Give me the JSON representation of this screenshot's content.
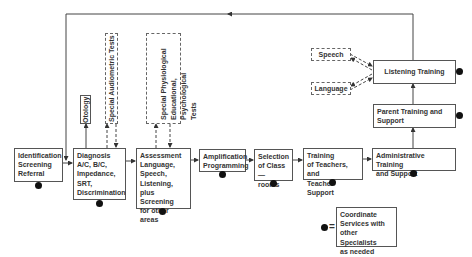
{
  "diagram": {
    "nodes": {
      "identification": {
        "lines": [
          "Identification",
          "Screening",
          "Referral"
        ]
      },
      "diagnosis": {
        "lines": [
          "Diagnosis",
          "A/C, B/C,",
          "Impedance,",
          "SRT,",
          "Discrimination"
        ]
      },
      "otology": {
        "label": "Otology"
      },
      "special_audiometric": {
        "label": "Special Audiometric Tests"
      },
      "special_physiological": {
        "text": "Special Physiological\nEducational, Psychological\nTests"
      },
      "assessment": {
        "lines": [
          "Assessment",
          "Language,",
          "Speech,",
          "Listening,",
          "plus Screening",
          "for other areas"
        ]
      },
      "amplification": {
        "lines": [
          "Amplification",
          "Programming"
        ]
      },
      "selection": {
        "lines": [
          "Selection",
          "of Class—",
          "rooms"
        ]
      },
      "training_teachers": {
        "lines": [
          "Training",
          "of Teachers, and",
          "Teacher Support"
        ]
      },
      "administrative": {
        "lines": [
          "Administrative Training",
          "and Support"
        ]
      },
      "parent_training": {
        "lines": [
          "Parent Training and",
          "Support"
        ]
      },
      "listening_training": {
        "label": "Listening Training"
      },
      "speech": {
        "label": "Speech"
      },
      "language": {
        "label": "Language"
      }
    },
    "legend": {
      "symbol": "=",
      "lines": [
        "Coordinate",
        "Services with",
        "other Specialists",
        "as needed"
      ]
    },
    "colors": {
      "line": "#444444",
      "dot": "#111111",
      "border": "#555555"
    }
  }
}
